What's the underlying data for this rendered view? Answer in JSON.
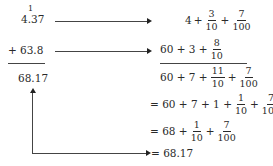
{
  "left_column": {
    "carry": "1",
    "addend1": "4.37",
    "operator": "+",
    "addend2": "63.8",
    "sum": "68.17"
  },
  "right_column": {
    "step1": {
      "terms": [
        "4",
        "+"
      ],
      "fracs": [
        {
          "n": "3",
          "d": "10"
        },
        {
          "n": "7",
          "d": "100"
        }
      ]
    },
    "step2": {
      "prefix": "60 + 3 +",
      "frac": {
        "n": "8",
        "d": "10"
      }
    },
    "step3": {
      "prefix": "60 + 7 +",
      "frac1": {
        "n": "11",
        "d": "10"
      },
      "plus": "+",
      "frac2": {
        "n": "7",
        "d": "100"
      }
    },
    "step4": {
      "prefix": "= 60 + 7 + 1 +",
      "frac1": {
        "n": "1",
        "d": "10"
      },
      "plus": "+",
      "frac2": {
        "n": "7",
        "d": "100"
      }
    },
    "step5": {
      "prefix": "= 68 +",
      "frac1": {
        "n": "1",
        "d": "10"
      },
      "plus": "+",
      "frac2": {
        "n": "7",
        "d": "100"
      }
    },
    "result": "= 68.17"
  },
  "colors": {
    "ink": "#2a2a2a",
    "arrow": "#444444"
  }
}
